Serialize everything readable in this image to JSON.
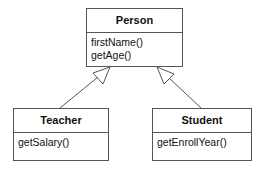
{
  "diagram": {
    "type": "uml-class-diagram",
    "classes": [
      {
        "id": "person",
        "name": "Person",
        "operations": [
          "firstName()",
          "getAge()"
        ]
      },
      {
        "id": "teacher",
        "name": "Teacher",
        "operations": [
          "getSalary()"
        ]
      },
      {
        "id": "student",
        "name": "Student",
        "operations": [
          "getEnrollYear()"
        ]
      }
    ],
    "relationships": [
      {
        "type": "generalization",
        "from": "Teacher",
        "to": "Person"
      },
      {
        "type": "generalization",
        "from": "Student",
        "to": "Person"
      }
    ]
  }
}
